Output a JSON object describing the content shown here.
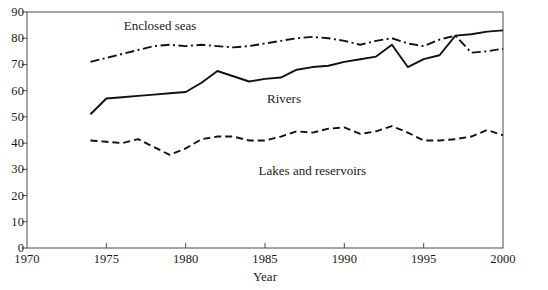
{
  "chart_data": {
    "type": "line",
    "title": "",
    "xlabel": "Year",
    "ylabel": "",
    "xlim": [
      1970,
      2000
    ],
    "ylim": [
      0,
      90
    ],
    "grid": false,
    "legend_position": "inline-annotations",
    "xticks": [
      "1970",
      "1975",
      "1980",
      "1985",
      "1990",
      "1995",
      "2000"
    ],
    "yticks": [
      "0",
      "10",
      "20",
      "30",
      "40",
      "50",
      "60",
      "70",
      "80",
      "90"
    ],
    "x": [
      1974,
      1975,
      1976,
      1977,
      1978,
      1979,
      1980,
      1981,
      1982,
      1983,
      1984,
      1985,
      1986,
      1987,
      1988,
      1989,
      1990,
      1991,
      1992,
      1993,
      1994,
      1995,
      1996,
      1997,
      1998,
      1999,
      2000
    ],
    "series": [
      {
        "name": "Enclosed seas",
        "line_style": "dash-dot",
        "color": "#111111",
        "values": [
          71.0,
          72.5,
          74.0,
          75.5,
          77.0,
          77.5,
          77.0,
          77.5,
          77.0,
          76.5,
          77.0,
          78.0,
          79.0,
          80.0,
          80.5,
          80.0,
          79.0,
          77.5,
          79.0,
          80.0,
          78.0,
          77.0,
          79.5,
          81.0,
          74.5,
          75.0,
          76.0
        ]
      },
      {
        "name": "Rivers",
        "line_style": "solid",
        "color": "#111111",
        "values": [
          51.0,
          57.0,
          57.5,
          58.0,
          58.5,
          59.0,
          59.5,
          63.0,
          67.5,
          65.5,
          63.5,
          64.5,
          65.0,
          68.0,
          69.0,
          69.5,
          71.0,
          72.0,
          73.0,
          77.5,
          69.0,
          72.0,
          73.5,
          81.0,
          81.5,
          82.5,
          83.0
        ]
      },
      {
        "name": "Lakes and reservoirs",
        "line_style": "dashed",
        "color": "#111111",
        "values": [
          41.0,
          40.5,
          40.0,
          41.5,
          38.5,
          35.5,
          38.0,
          41.5,
          42.5,
          42.5,
          41.0,
          41.0,
          42.5,
          44.5,
          44.0,
          45.5,
          46.0,
          43.5,
          44.5,
          46.5,
          44.0,
          41.0,
          41.0,
          41.5,
          42.5,
          45.0,
          43.0
        ]
      }
    ],
    "annotations": [
      {
        "text": "Enclosed seas",
        "x": 1978.4,
        "y": 84.5
      },
      {
        "text": "Rivers",
        "x": 1986.2,
        "y": 57.0
      },
      {
        "text": "Lakes and reservoirs",
        "x": 1988.0,
        "y": 29.5
      }
    ]
  }
}
